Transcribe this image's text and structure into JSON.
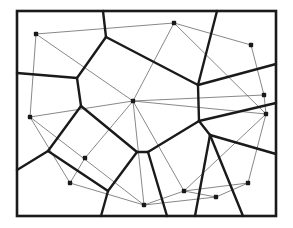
{
  "diagram": {
    "type": "voronoi-delaunay",
    "colors": {
      "frame": "#1a1a1a",
      "voronoi_edges": "#1a1a1a",
      "delaunay_edges": "#6a6a6a",
      "sites": "#1a1a1a"
    },
    "frame": {
      "x": 17,
      "y": 11,
      "width": 259,
      "height": 205
    },
    "sites": [
      {
        "id": "p1",
        "x": 36,
        "y": 34
      },
      {
        "id": "p2",
        "x": 174,
        "y": 23
      },
      {
        "id": "p3",
        "x": 251,
        "y": 45
      },
      {
        "id": "p4",
        "x": 133,
        "y": 101
      },
      {
        "id": "p5",
        "x": 264,
        "y": 95
      },
      {
        "id": "p6",
        "x": 266,
        "y": 114
      },
      {
        "id": "p7",
        "x": 30,
        "y": 117
      },
      {
        "id": "p8",
        "x": 85,
        "y": 158
      },
      {
        "id": "p9",
        "x": 70,
        "y": 183
      },
      {
        "id": "p10",
        "x": 184,
        "y": 191
      },
      {
        "id": "p11",
        "x": 248,
        "y": 183
      },
      {
        "id": "p12",
        "x": 216,
        "y": 197
      },
      {
        "id": "p13",
        "x": 144,
        "y": 205
      }
    ],
    "voronoi_edges": [
      [
        103,
        11,
        106,
        37
      ],
      [
        106,
        37,
        77,
        78
      ],
      [
        77,
        78,
        17,
        73
      ],
      [
        106,
        37,
        198,
        85
      ],
      [
        198,
        85,
        217,
        11
      ],
      [
        198,
        85,
        276,
        64
      ],
      [
        198,
        85,
        199,
        121
      ],
      [
        199,
        121,
        276,
        103
      ],
      [
        77,
        78,
        81,
        106
      ],
      [
        81,
        106,
        48,
        151
      ],
      [
        48,
        151,
        17,
        170
      ],
      [
        81,
        106,
        137,
        152
      ],
      [
        48,
        151,
        108,
        191
      ],
      [
        108,
        191,
        101,
        216
      ],
      [
        108,
        191,
        137,
        152
      ],
      [
        137,
        152,
        148,
        152
      ],
      [
        148,
        152,
        199,
        121
      ],
      [
        199,
        121,
        210,
        135
      ],
      [
        210,
        135,
        276,
        154
      ],
      [
        148,
        152,
        167,
        216
      ],
      [
        210,
        135,
        195,
        216
      ],
      [
        210,
        135,
        243,
        216
      ]
    ],
    "delaunay_edges": [
      [
        "p1",
        "p2"
      ],
      [
        "p1",
        "p4"
      ],
      [
        "p1",
        "p7"
      ],
      [
        "p2",
        "p3"
      ],
      [
        "p2",
        "p4"
      ],
      [
        "p2",
        "p6"
      ],
      [
        "p3",
        "p5"
      ],
      [
        "p4",
        "p5"
      ],
      [
        "p4",
        "p6"
      ],
      [
        "p4",
        "p7"
      ],
      [
        "p4",
        "p8"
      ],
      [
        "p4",
        "p10"
      ],
      [
        "p4",
        "p13"
      ],
      [
        "p5",
        "p6"
      ],
      [
        "p6",
        "p10"
      ],
      [
        "p6",
        "p11"
      ],
      [
        "p7",
        "p9"
      ],
      [
        "p7",
        "p13"
      ],
      [
        "p8",
        "p9"
      ],
      [
        "p9",
        "p13"
      ],
      [
        "p10",
        "p11"
      ],
      [
        "p10",
        "p12"
      ],
      [
        "p11",
        "p12"
      ],
      [
        "p12",
        "p13"
      ],
      [
        "p10",
        "p13"
      ]
    ]
  }
}
